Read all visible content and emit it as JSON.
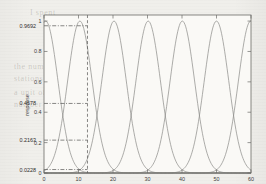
{
  "figure": {
    "background_color": "#f0efeb",
    "plot_background": "#faf9f6",
    "frame_color": "#6b6b68",
    "curve_color": "#8a8a86",
    "guide_color": "#555553"
  },
  "ghost_text": [
    {
      "text": "I spent",
      "x": 30,
      "y": 8
    },
    {
      "text": "the numbers of",
      "x": 14,
      "y": 62
    },
    {
      "text": "stations and a",
      "x": 14,
      "y": 74
    },
    {
      "text": "a unit of time",
      "x": 14,
      "y": 88
    },
    {
      "text": "number of",
      "x": 14,
      "y": 100
    }
  ],
  "chart_data": {
    "type": "line",
    "title": "",
    "xlabel": "",
    "ylabel": "response",
    "xlim": [
      0,
      60
    ],
    "ylim": [
      0,
      1.04
    ],
    "grid": false,
    "legend": false,
    "legend_position": "none",
    "y_ticks": [
      0,
      0.2,
      0.4,
      0.6,
      0.8,
      1
    ],
    "y_tick_labels": [
      "0",
      "0.2",
      "0.4",
      "0.6",
      "0.8",
      "1"
    ],
    "x_ticks": [
      0,
      10,
      20,
      30,
      40,
      50,
      60
    ],
    "x_tick_labels": [
      "0",
      "10",
      "20",
      "30",
      "40",
      "50",
      "60"
    ],
    "x_tick_labels_visible": false,
    "annotation_y_labels": [
      "0.9692",
      "0.4578",
      "0.2163",
      "0.0228"
    ],
    "annotation_y_values": [
      0.9692,
      0.4578,
      0.2163,
      0.0228
    ],
    "cursor_x": 12.6,
    "curve_type": "gaussian",
    "curve_sigma": 3.55,
    "series": [
      {
        "name": "mf1",
        "center": 0.5
      },
      {
        "name": "mf2",
        "center": 10.4
      },
      {
        "name": "mf3",
        "center": 20.3
      },
      {
        "name": "mf4",
        "center": 30.2
      },
      {
        "name": "mf5",
        "center": 40.1
      },
      {
        "name": "mf6",
        "center": 50.0
      },
      {
        "name": "mf7",
        "center": 59.9
      }
    ]
  }
}
